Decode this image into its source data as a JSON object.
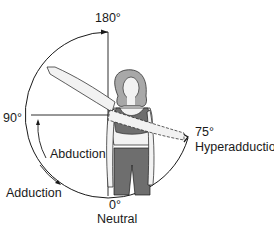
{
  "diagram": {
    "type": "range-of-motion",
    "labels": {
      "top": "180°",
      "left": "90°",
      "bottom_angle": "0°",
      "bottom_name": "Neutral",
      "right_angle": "75°",
      "right_name": "Hyperadduction",
      "abduction": "Abduction",
      "adduction": "Adduction"
    },
    "colors": {
      "line": "#1a1a1a",
      "clothing": "#6e6e6e",
      "hair": "#a8a8a8",
      "skin": "#f2f2f2"
    }
  }
}
